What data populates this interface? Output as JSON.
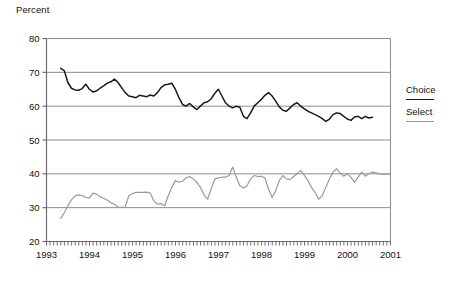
{
  "chart_data": {
    "type": "line",
    "title": "",
    "ylabel": "Percent",
    "xlabel": "",
    "ylim": [
      20,
      80
    ],
    "yticks": [
      20,
      30,
      40,
      50,
      60,
      70,
      80
    ],
    "xlim": [
      "1993",
      "2001"
    ],
    "xticks": [
      "1993",
      "1994",
      "1995",
      "1996",
      "1997",
      "1998",
      "1999",
      "2000",
      "2001"
    ],
    "grid": true,
    "minor_ticks": "monthly",
    "legend_position": "right",
    "series": [
      {
        "name": "Choice",
        "color": "#1a1a1a",
        "x_start": 1993.33,
        "x_step": 0.08333,
        "values": [
          71.2,
          70.5,
          67.0,
          65.3,
          64.8,
          64.7,
          65.2,
          66.5,
          65.0,
          64.2,
          64.5,
          65.3,
          66.0,
          66.8,
          67.2,
          68.0,
          67.0,
          65.5,
          64.0,
          63.0,
          62.8,
          62.5,
          63.2,
          63.0,
          62.8,
          63.3,
          63.0,
          64.0,
          65.5,
          66.3,
          66.5,
          66.8,
          65.0,
          62.5,
          60.5,
          60.0,
          60.8,
          59.8,
          59.0,
          60.0,
          61.0,
          61.3,
          62.2,
          63.8,
          65.0,
          63.0,
          61.0,
          60.0,
          59.5,
          60.0,
          59.7,
          57.0,
          56.3,
          58.0,
          60.0,
          61.0,
          62.0,
          63.2,
          64.0,
          63.0,
          61.5,
          59.8,
          58.8,
          58.5,
          59.5,
          60.5,
          61.0,
          60.0,
          59.2,
          58.5,
          58.0,
          57.5,
          57.0,
          56.3,
          55.5,
          56.2,
          57.5,
          58.0,
          57.8,
          57.0,
          56.2,
          55.8,
          56.8,
          57.0,
          56.3,
          57.0,
          56.5,
          56.7
        ]
      },
      {
        "name": "Select",
        "color": "#9a9a9a",
        "x_start": 1993.33,
        "x_step": 0.08333,
        "values": [
          26.8,
          28.5,
          30.5,
          32.3,
          33.5,
          33.8,
          33.6,
          33.0,
          32.8,
          34.3,
          34.0,
          33.2,
          32.8,
          32.2,
          31.5,
          31.0,
          30.2,
          30.1,
          30.2,
          33.5,
          34.2,
          34.5,
          34.5,
          34.5,
          34.6,
          34.3,
          32.0,
          31.0,
          31.2,
          30.5,
          33.5,
          36.0,
          38.0,
          37.5,
          37.8,
          38.8,
          39.2,
          38.5,
          37.5,
          36.0,
          33.8,
          32.5,
          35.5,
          38.5,
          38.8,
          39.0,
          39.0,
          39.5,
          42.0,
          39.0,
          36.5,
          35.8,
          36.5,
          38.5,
          39.5,
          39.2,
          39.3,
          38.8,
          35.5,
          33.0,
          35.0,
          38.0,
          39.5,
          38.5,
          38.3,
          39.2,
          40.0,
          41.0,
          39.5,
          38.0,
          36.0,
          34.5,
          32.5,
          33.5,
          36.0,
          38.5,
          40.5,
          41.5,
          40.2,
          39.3,
          40.0,
          39.0,
          37.5,
          39.0,
          40.5,
          39.3,
          40.0,
          40.5,
          40.3,
          40.0,
          39.8,
          39.9,
          40.0
        ]
      }
    ]
  },
  "legend": {
    "items": [
      {
        "label": "Choice"
      },
      {
        "label": "Select"
      }
    ]
  }
}
